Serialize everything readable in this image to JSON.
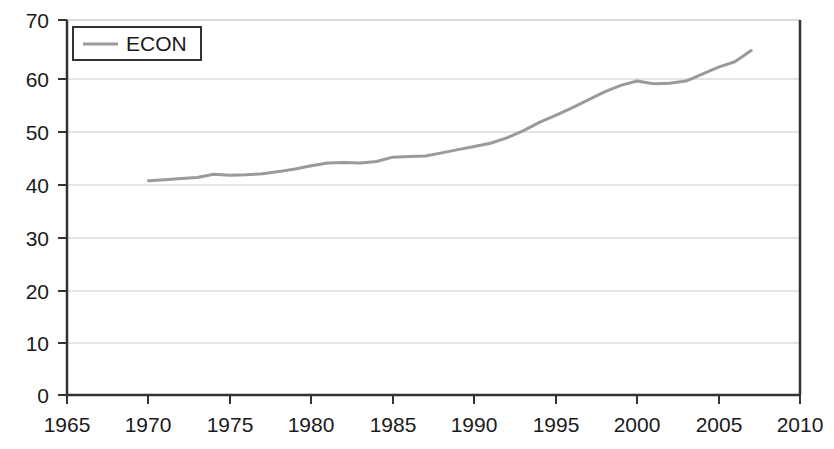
{
  "chart_data": {
    "type": "line",
    "title": "",
    "xlabel": "",
    "ylabel": "",
    "xlim": [
      1965,
      2010
    ],
    "ylim": [
      0,
      70
    ],
    "grid": true,
    "grid_axis": "y",
    "legend": {
      "position": "top-left-inside",
      "entries": [
        {
          "name": "ECON",
          "color": "#9a9a9a"
        }
      ]
    },
    "x_ticks": [
      1965,
      1970,
      1975,
      1980,
      1985,
      1990,
      1995,
      2000,
      2005,
      2010
    ],
    "x_tick_labels": [
      "1965",
      "1970",
      "1975",
      "1980",
      "1985",
      "1990",
      "1995",
      "2000",
      "2005",
      "2010"
    ],
    "y_ticks": [
      0,
      10,
      20,
      30,
      40,
      50,
      60,
      70
    ],
    "y_tick_labels": [
      "0",
      "10",
      "20",
      "30",
      "40",
      "50",
      "60",
      "70"
    ],
    "series": [
      {
        "name": "ECON",
        "color": "#9a9a9a",
        "line_width": 3,
        "x": [
          1970,
          1971,
          1972,
          1973,
          1974,
          1975,
          1976,
          1977,
          1978,
          1979,
          1980,
          1981,
          1982,
          1983,
          1984,
          1985,
          1986,
          1987,
          1988,
          1989,
          1990,
          1991,
          1992,
          1993,
          1994,
          1995,
          1996,
          1997,
          1998,
          1999,
          2000,
          2001,
          2002,
          2003,
          2004,
          2005,
          2006,
          2007
        ],
        "values": [
          40.0,
          40.2,
          40.4,
          40.6,
          41.2,
          41.0,
          41.1,
          41.3,
          41.7,
          42.2,
          42.8,
          43.3,
          43.4,
          43.3,
          43.6,
          44.4,
          44.5,
          44.6,
          45.2,
          45.8,
          46.4,
          47.0,
          48.0,
          49.3,
          50.9,
          52.2,
          53.6,
          55.1,
          56.6,
          57.8,
          58.6,
          58.1,
          58.2,
          58.6,
          59.9,
          61.2,
          62.2,
          64.3
        ]
      }
    ]
  },
  "legend": {
    "label": "ECON"
  },
  "axes": {
    "x_labels": [
      "1965",
      "1970",
      "1975",
      "1980",
      "1985",
      "1990",
      "1995",
      "2000",
      "2005",
      "2010"
    ],
    "y_labels": [
      "70",
      "60",
      "50",
      "40",
      "30",
      "20",
      "10",
      "0"
    ]
  }
}
